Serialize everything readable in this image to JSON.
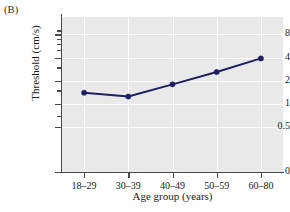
{
  "figure": {
    "panel_label": "(B)"
  },
  "chart_data": {
    "type": "line",
    "title": "",
    "panel": "(B)",
    "xlabel": "Age group (years)",
    "ylabel": "Threshold (cm/s)",
    "categories": [
      "18–29",
      "30–39",
      "40–49",
      "50–59",
      "60–80"
    ],
    "values": [
      1.4,
      1.25,
      1.8,
      2.6,
      3.9
    ],
    "series": [
      {
        "name": "Threshold",
        "values": [
          1.4,
          1.25,
          1.8,
          2.6,
          3.9
        ],
        "color": "#1d2060",
        "marker": "circle"
      }
    ],
    "yscale": "log",
    "ylim": [
      0.4,
      9.5
    ],
    "ytick_labels": [
      "8",
      "4",
      "2",
      "1",
      "0.5",
      "0"
    ],
    "ytick_values": [
      8,
      4,
      2,
      1,
      0.5,
      0
    ],
    "yaxis_has_break_at_zero": true,
    "yminor_ticks": [
      9,
      7,
      6,
      5,
      3,
      1.5,
      0.7
    ],
    "xtick_labels": [
      "18–29",
      "30–39",
      "40–49",
      "50–59",
      "60–80"
    ],
    "grid": true,
    "grid_color": "#ffffff",
    "plot_background": "#e9e9e9",
    "legend": null,
    "legend_position": "none"
  }
}
